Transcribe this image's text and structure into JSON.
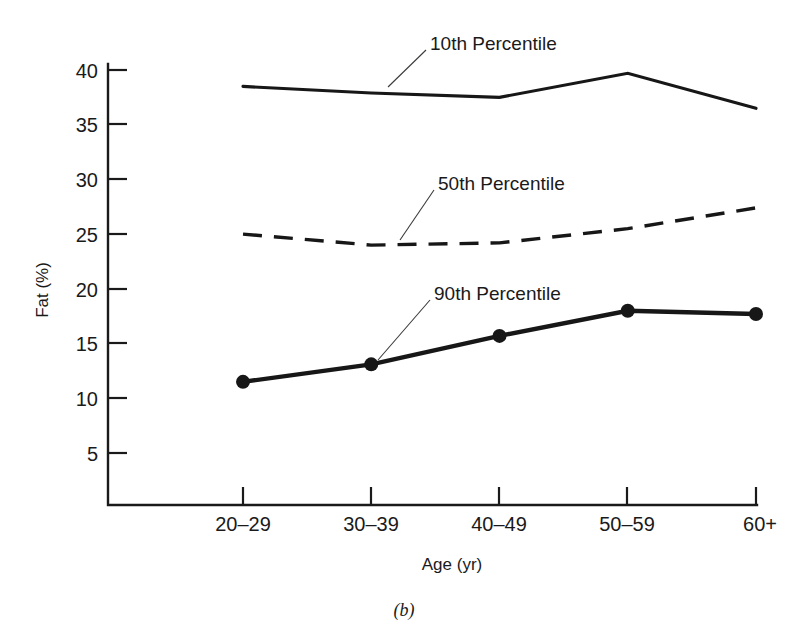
{
  "figure": {
    "panel_letter": "(b)"
  },
  "chart_data": {
    "type": "line",
    "title": "",
    "xlabel": "Age (yr)",
    "ylabel": "Fat (%)",
    "categories": [
      "20–29",
      "30–39",
      "40–49",
      "50–59",
      "60+"
    ],
    "ytick_labels": [
      "5",
      "10",
      "15",
      "20",
      "25",
      "30",
      "35",
      "40"
    ],
    "ytick_values": [
      5,
      10,
      15,
      20,
      25,
      30,
      35,
      40
    ],
    "ylim": [
      0.2,
      41.5
    ],
    "grid": false,
    "legend_position": "inline-annotations",
    "series": [
      {
        "name": "10th Percentile",
        "style": "solid",
        "markers": false,
        "values": [
          38.5,
          37.9,
          37.5,
          39.7,
          36.5
        ]
      },
      {
        "name": "50th Percentile",
        "style": "dashed",
        "markers": false,
        "values": [
          25.0,
          24.0,
          24.2,
          25.5,
          27.4
        ]
      },
      {
        "name": "90th Percentile",
        "style": "thick-solid",
        "markers": true,
        "values": [
          11.5,
          13.1,
          15.7,
          18.0,
          17.7
        ]
      }
    ],
    "annotations": [
      {
        "text": "10th Percentile",
        "points_to_series": "10th Percentile"
      },
      {
        "text": "50th Percentile",
        "points_to_series": "50th Percentile"
      },
      {
        "text": "90th Percentile",
        "points_to_series": "90th Percentile"
      }
    ]
  }
}
